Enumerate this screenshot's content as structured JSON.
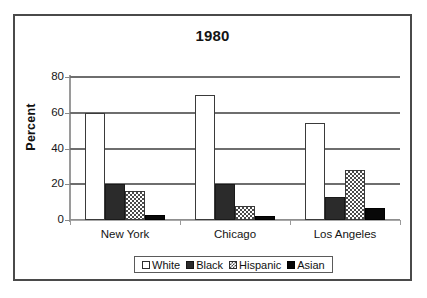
{
  "chart_data": {
    "type": "bar",
    "title": "1980",
    "xlabel": "",
    "ylabel": "Percent",
    "categories": [
      "New York",
      "Chicago",
      "Los Angeles"
    ],
    "series": [
      {
        "name": "White",
        "values": [
          60,
          70,
          54
        ],
        "swatch": "white-outline"
      },
      {
        "name": "Black",
        "values": [
          20,
          20,
          13
        ],
        "swatch": "dark-gray-solid"
      },
      {
        "name": "Hispanic",
        "values": [
          16,
          8,
          28
        ],
        "swatch": "checkerboard-hatch"
      },
      {
        "name": "Asian",
        "values": [
          3,
          2,
          7
        ],
        "swatch": "black-solid"
      }
    ],
    "ylim": [
      0,
      80
    ],
    "yticks": [
      0,
      20,
      40,
      60,
      80
    ],
    "ytick_labels": [
      "0",
      "20",
      "40",
      "60",
      "80"
    ],
    "grid": true,
    "legend_position": "bottom",
    "colors": {
      "white_series": "#ffffff",
      "black_series": "#2b2b2b",
      "hispanic_series": "#4a4a4a",
      "asian_series": "#080808",
      "gridline": "#6e6e6e",
      "frame": "#4a4a4a",
      "text": "#141414"
    }
  },
  "legend": {
    "entries": [
      {
        "label": "White"
      },
      {
        "label": "Black"
      },
      {
        "label": "Hispanic"
      },
      {
        "label": "Asian"
      }
    ]
  }
}
